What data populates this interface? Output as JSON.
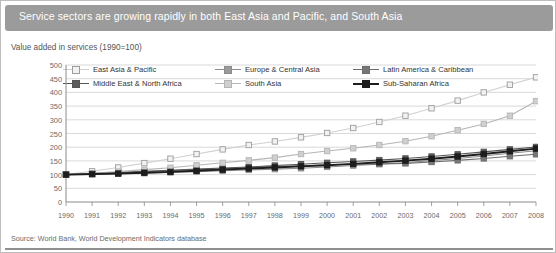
{
  "title": "Service sectors are growing rapidly in both East Asia and Pacific, and South Asia",
  "subtitle": "Value added in services (1990=100)",
  "source": "Source: World Bank, World Development Indicators database",
  "colors": {
    "title_bar": "#9b9b9b",
    "grid": "#c9c9c9",
    "axis": "#8a8a8a",
    "east_asia_pacific": "#d0d0d0",
    "europe_central_asia": "#8c8c8c",
    "latin_america_caribbean": "#6e6e6e",
    "middle_east_north_africa": "#555555",
    "south_asia": "#b5b5b5",
    "sub_saharan_africa": "#1d1d1d"
  },
  "chart_data": {
    "type": "line",
    "title": "Service sectors are growing rapidly in both East Asia and Pacific, and South Asia",
    "subtitle": "Value added in services (1990=100)",
    "xlabel": "",
    "ylabel": "",
    "ylim": [
      0,
      500
    ],
    "ytick_step": 50,
    "yticks": [
      0,
      50,
      100,
      150,
      200,
      250,
      300,
      350,
      400,
      450,
      500
    ],
    "grid": true,
    "legend_position": "top",
    "marker": "square",
    "x": [
      1990,
      1991,
      1992,
      1993,
      1994,
      1995,
      1996,
      1997,
      1998,
      1999,
      2000,
      2001,
      2002,
      2003,
      2004,
      2005,
      2006,
      2007,
      2008
    ],
    "series": [
      {
        "name": "East Asia & Pacific",
        "key": "east_asia_pacific",
        "color": "#d0d0d0",
        "marker_fill": "#f2f2f2",
        "values": [
          100,
          112,
          126,
          142,
          158,
          175,
          192,
          208,
          221,
          236,
          252,
          270,
          292,
          315,
          342,
          370,
          400,
          428,
          455
        ]
      },
      {
        "name": "Europe & Central Asia",
        "key": "europe_central_asia",
        "color": "#8c8c8c",
        "marker_fill": "#9a9a9a",
        "values": [
          100,
          101,
          103,
          105,
          108,
          111,
          114,
          117,
          120,
          123,
          128,
          133,
          138,
          144,
          151,
          159,
          168,
          178,
          187
        ]
      },
      {
        "name": "Latin America & Caribbean",
        "key": "latin_america_caribbean",
        "color": "#6e6e6e",
        "marker_fill": "#777777",
        "values": [
          100,
          103,
          106,
          110,
          115,
          118,
          121,
          126,
          130,
          132,
          136,
          138,
          139,
          141,
          146,
          152,
          159,
          167,
          174
        ]
      },
      {
        "name": "Middle East & North Africa",
        "key": "middle_east_north_africa",
        "color": "#555555",
        "marker_fill": "#5c5c5c",
        "values": [
          100,
          104,
          108,
          112,
          116,
          120,
          124,
          128,
          133,
          138,
          143,
          148,
          153,
          159,
          166,
          174,
          183,
          192,
          201
        ]
      },
      {
        "name": "South Asia",
        "key": "south_asia",
        "color": "#b5b5b5",
        "marker_fill": "#cfcfcf",
        "values": [
          100,
          105,
          111,
          118,
          125,
          134,
          143,
          152,
          162,
          175,
          186,
          196,
          208,
          222,
          240,
          262,
          285,
          315,
          368
        ]
      },
      {
        "name": "Sub-Saharan Africa",
        "key": "sub_saharan_africa",
        "color": "#1d1d1d",
        "marker_fill": "#1d1d1d",
        "values": [
          100,
          102,
          104,
          107,
          110,
          114,
          118,
          122,
          126,
          130,
          134,
          139,
          145,
          151,
          158,
          166,
          175,
          185,
          195
        ]
      }
    ]
  }
}
